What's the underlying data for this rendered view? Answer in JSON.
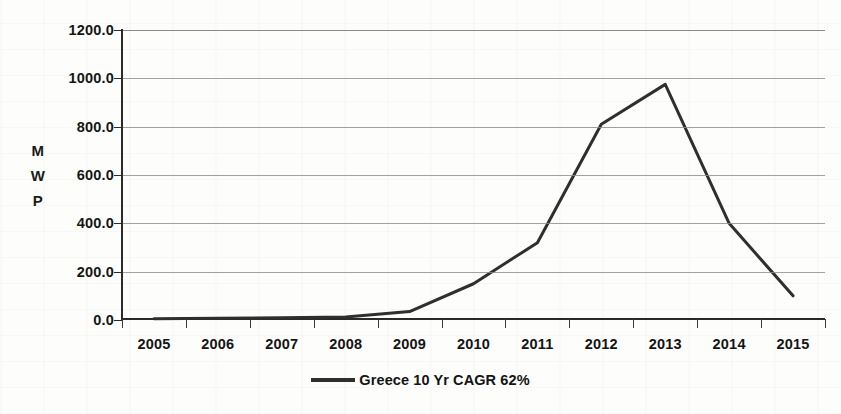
{
  "chart_data": {
    "type": "line",
    "title": "",
    "xlabel": "",
    "ylabel": "MWP",
    "ylabel_letters": [
      "M",
      "W",
      "P"
    ],
    "categories": [
      "2005",
      "2006",
      "2007",
      "2008",
      "2009",
      "2010",
      "2011",
      "2012",
      "2013",
      "2014",
      "2015"
    ],
    "series": [
      {
        "name": "Greece 10 Yr CAGR 62%",
        "color": "#2f2f2f",
        "values": [
          5,
          7,
          9,
          12,
          35,
          150,
          320,
          810,
          975,
          400,
          100
        ]
      }
    ],
    "ylim": [
      0,
      1200
    ],
    "ytick_values": [
      0,
      200,
      400,
      600,
      800,
      1000,
      1200
    ],
    "ytick_labels": [
      "0.0",
      "200.0",
      "400.0",
      "600.0",
      "800.0",
      "1000.0",
      "1200.0"
    ],
    "grid": true,
    "grid_axis": "y",
    "legend_position": "bottom-center",
    "line_width": 3
  },
  "legend": {
    "entries": [
      {
        "label": "Greece 10 Yr CAGR 62%",
        "swatch_color": "#2f2f2f"
      }
    ]
  },
  "colors": {
    "series_line": "#2f2f2f",
    "gridline": "#8c8c8c",
    "axis": "#2a2a2a",
    "text": "#141414",
    "background": "#fdfdfc"
  }
}
